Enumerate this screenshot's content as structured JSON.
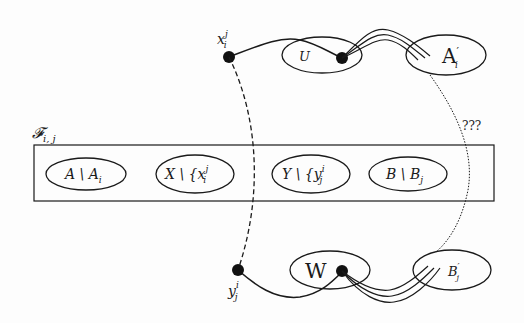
{
  "diagram": {
    "family_label": "𝓕",
    "family_sub": "i, j",
    "question_label": "???",
    "top": {
      "vertex_x_label": "x",
      "vertex_x_sup": "j",
      "vertex_x_sub": "i",
      "set_U_label": "U",
      "set_A_prime_label": "A",
      "set_A_prime_mark": "′",
      "set_A_prime_sub": "i"
    },
    "bottom": {
      "vertex_y_label": "y",
      "vertex_y_sup": "i",
      "vertex_y_sub": "j",
      "set_W_label": "W",
      "set_B_prime_label": "B",
      "set_B_prime_mark": "′",
      "set_B_prime_sub": "j"
    },
    "box_sets": [
      {
        "main": "A \\ A",
        "sub": "i",
        "sup": ""
      },
      {
        "main": "X \\ {x",
        "sub": "i",
        "sup": "j"
      },
      {
        "main": "Y \\ {y",
        "sub": "j",
        "sup": "i"
      },
      {
        "main": "B \\ B",
        "sub": "j",
        "sup": ""
      }
    ]
  },
  "colors": {
    "ink": "#1a1a1a",
    "background": "#fdfdfd"
  }
}
